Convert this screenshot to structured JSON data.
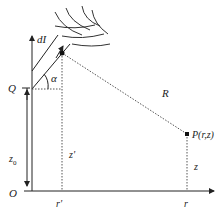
{
  "diagram": {
    "type": "physics-geometry",
    "labels": {
      "current_element": "dI",
      "point_Q": "Q",
      "angle": "α",
      "distance": "R",
      "field_point": "P(r,z)",
      "z_source": "z'",
      "z_point": "z",
      "z0": "z",
      "z0_sub": "0",
      "origin": "O",
      "r_source": "r'",
      "r_point": "r"
    },
    "colors": {
      "line": "#222222",
      "dotted": "#555555",
      "background": "#ffffff"
    }
  }
}
